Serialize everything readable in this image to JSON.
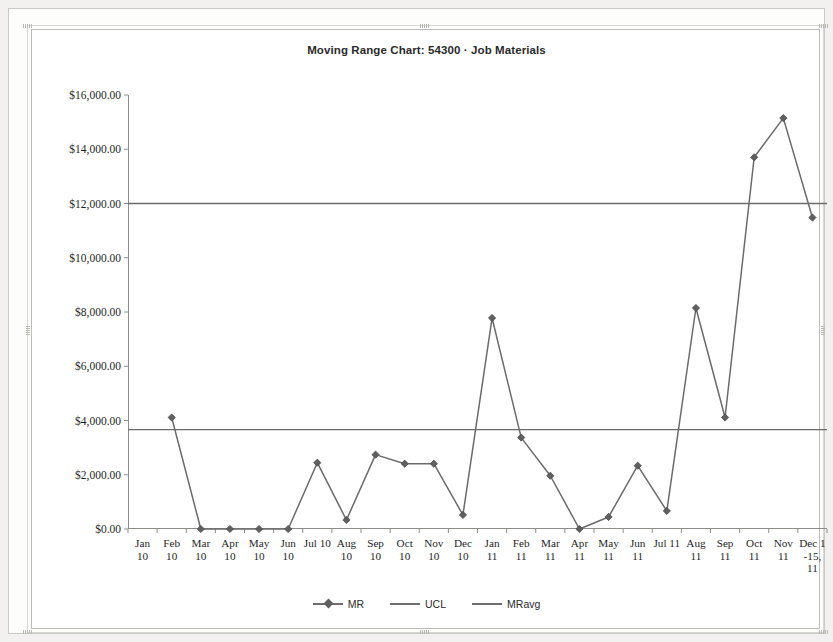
{
  "chart_data": {
    "type": "line",
    "title": "Moving Range Chart: 54300 · Job Materials",
    "xlabel": "",
    "ylabel": "",
    "ylim": [
      0,
      16000
    ],
    "ytick_step": 2000,
    "ytick_labels": [
      "$0.00",
      "$2,000.00",
      "$4,000.00",
      "$6,000.00",
      "$8,000.00",
      "$10,000.00",
      "$12,000.00",
      "$14,000.00",
      "$16,000.00"
    ],
    "grid": false,
    "legend_position": "bottom",
    "categories": [
      "Jan\n10",
      "Feb\n10",
      "Mar\n10",
      "Apr\n10",
      "May\n10",
      "Jun\n10",
      "Jul 10",
      "Aug\n10",
      "Sep\n10",
      "Oct\n10",
      "Nov\n10",
      "Dec\n10",
      "Jan\n11",
      "Feb\n11",
      "Mar\n11",
      "Apr\n11",
      "May\n11",
      "Jun\n11",
      "Jul 11",
      "Aug\n11",
      "Sep\n11",
      "Oct\n11",
      "Nov\n11",
      "Dec 1\n-15,\n11"
    ],
    "series": [
      {
        "name": "MR",
        "marker": "diamond",
        "color": "#6b6b6b",
        "values": [
          null,
          4111,
          0,
          0,
          0,
          0,
          2444,
          333,
          2741,
          2407,
          2407,
          518,
          7778,
          3370,
          1963,
          0,
          444,
          2333,
          667,
          8148,
          4111,
          13704,
          15148,
          11481
        ]
      },
      {
        "name": "UCL",
        "marker": "none",
        "color": "#6b6b6b",
        "constant": 12000
      },
      {
        "name": "MRavg",
        "marker": "none",
        "color": "#6b6b6b",
        "constant": 3667
      }
    ],
    "legend": [
      "MR",
      "UCL",
      "MRavg"
    ]
  }
}
